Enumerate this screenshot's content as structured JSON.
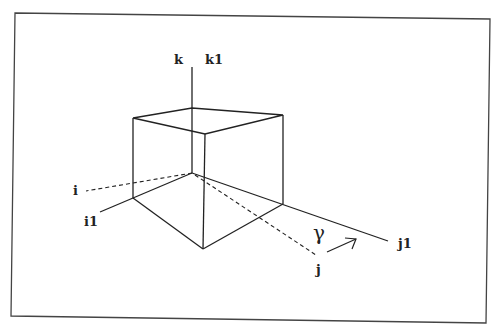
{
  "diagram": {
    "labels": {
      "k": "k",
      "k1": "k1",
      "i": "i",
      "i1": "i1",
      "j": "j",
      "j1": "j1",
      "gamma": "γ"
    },
    "colors": {
      "line": "#222222",
      "frame": "#444444",
      "background": "#ffffff"
    }
  }
}
